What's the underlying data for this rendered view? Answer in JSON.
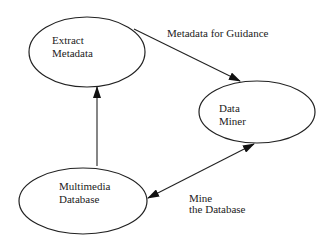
{
  "diagram": {
    "nodes": [
      {
        "id": "extract-metadata",
        "lines": [
          "Extract",
          "Metadata"
        ]
      },
      {
        "id": "data-miner",
        "lines": [
          "Data",
          "Miner"
        ]
      },
      {
        "id": "multimedia-database",
        "lines": [
          "Multimedia",
          "Database"
        ]
      }
    ],
    "edges": [
      {
        "from": "extract-metadata",
        "to": "data-miner",
        "label": [
          "Metadata for Guidance"
        ],
        "direction": "forward"
      },
      {
        "from": "multimedia-database",
        "to": "extract-metadata",
        "label": [],
        "direction": "forward"
      },
      {
        "from": "multimedia-database",
        "to": "data-miner",
        "label": [
          "Mine",
          "the Database"
        ],
        "direction": "both"
      }
    ]
  }
}
